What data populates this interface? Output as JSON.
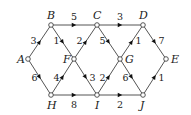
{
  "diagram": {
    "type": "directed-weighted-graph",
    "nodes": [
      {
        "id": "A",
        "x": 28,
        "y": 59,
        "label_dx": -11,
        "label_dy": 4
      },
      {
        "id": "B",
        "x": 51,
        "y": 25,
        "label_dx": -4,
        "label_dy": -6
      },
      {
        "id": "C",
        "x": 97,
        "y": 25,
        "label_dx": -4,
        "label_dy": -6
      },
      {
        "id": "D",
        "x": 143,
        "y": 25,
        "label_dx": -4,
        "label_dy": -6
      },
      {
        "id": "E",
        "x": 166,
        "y": 59,
        "label_dx": 5,
        "label_dy": 4
      },
      {
        "id": "F",
        "x": 74,
        "y": 59,
        "label_dx": -11,
        "label_dy": 4
      },
      {
        "id": "G",
        "x": 120,
        "y": 59,
        "label_dx": 5,
        "label_dy": 4
      },
      {
        "id": "H",
        "x": 51,
        "y": 95,
        "label_dx": -4,
        "label_dy": 14
      },
      {
        "id": "I",
        "x": 97,
        "y": 95,
        "label_dx": -2,
        "label_dy": 14
      },
      {
        "id": "J",
        "x": 143,
        "y": 95,
        "label_dx": -3,
        "label_dy": 14
      }
    ],
    "edges": [
      {
        "from": "A",
        "to": "B",
        "weight": "3",
        "lx": -9,
        "ly": 2
      },
      {
        "from": "A",
        "to": "H",
        "weight": "6",
        "lx": -8,
        "ly": 4
      },
      {
        "from": "B",
        "to": "C",
        "weight": "5",
        "lx": -3,
        "ly": -5
      },
      {
        "from": "B",
        "to": "F",
        "weight": "1",
        "lx": -9,
        "ly": 2
      },
      {
        "from": "F",
        "to": "C",
        "weight": "2",
        "lx": -9,
        "ly": 2
      },
      {
        "from": "C",
        "to": "D",
        "weight": "3",
        "lx": -3,
        "ly": -5
      },
      {
        "from": "C",
        "to": "G",
        "weight": "5",
        "lx": -9,
        "ly": 2
      },
      {
        "from": "G",
        "to": "D",
        "weight": "1",
        "lx": 4,
        "ly": 2
      },
      {
        "from": "D",
        "to": "E",
        "weight": "7",
        "lx": 4,
        "ly": 2
      },
      {
        "from": "H",
        "to": "F",
        "weight": "4",
        "lx": -9,
        "ly": 4
      },
      {
        "from": "F",
        "to": "I",
        "weight": "3",
        "lx": 4,
        "ly": 4
      },
      {
        "from": "I",
        "to": "G",
        "weight": "2",
        "lx": -9,
        "ly": 4
      },
      {
        "from": "G",
        "to": "J",
        "weight": "6",
        "lx": -9,
        "ly": 4
      },
      {
        "from": "J",
        "to": "E",
        "weight": "1",
        "lx": 4,
        "ly": 4
      },
      {
        "from": "H",
        "to": "I",
        "weight": "8",
        "lx": -3,
        "ly": 13
      },
      {
        "from": "I",
        "to": "J",
        "weight": "2",
        "lx": -3,
        "ly": 13
      }
    ]
  }
}
